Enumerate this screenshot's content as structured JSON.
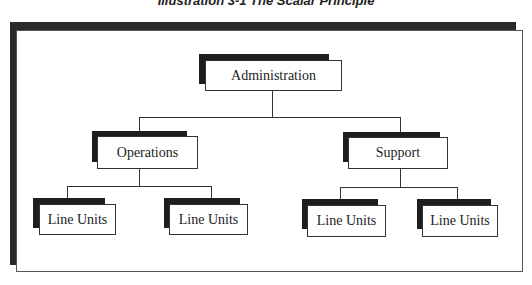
{
  "title": "Illustration 3-1 The Scalar Principle",
  "colors": {
    "shadow": "#1e1e1e",
    "line": "#333333",
    "box_fill": "#ffffff"
  },
  "org_chart": {
    "root": {
      "label": "Administration"
    },
    "level2": [
      {
        "label": "Operations"
      },
      {
        "label": "Support"
      }
    ],
    "level3": [
      {
        "label": "Line Units",
        "parent": "Operations"
      },
      {
        "label": "Line Units",
        "parent": "Operations"
      },
      {
        "label": "Line Units",
        "parent": "Support"
      },
      {
        "label": "Line Units",
        "parent": "Support"
      }
    ]
  }
}
